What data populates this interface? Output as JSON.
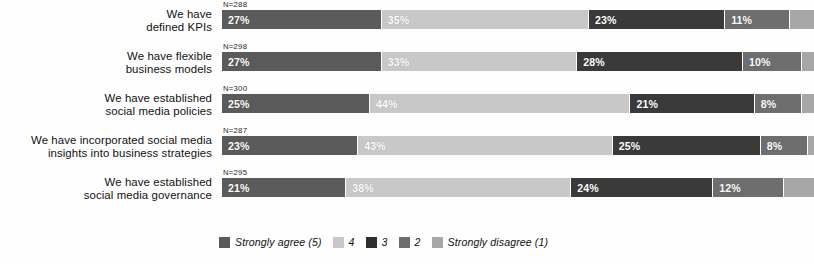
{
  "chart_data": {
    "type": "bar",
    "subtype": "100% stacked horizontal bar (Likert)",
    "title": "",
    "xlabel": "",
    "ylabel": "",
    "xlim": [
      0,
      100
    ],
    "grid": false,
    "legend_position": "bottom",
    "categories": [
      "We have defined KPIs",
      "We have flexible business models",
      "We have established social media policies",
      "We have incorporated social media insights into business strategies",
      "We have established social media governance"
    ],
    "series": [
      {
        "name": "Strongly agree (5)",
        "color": "#5b5b5b",
        "values": [
          27,
          27,
          25,
          23,
          21
        ]
      },
      {
        "name": "4",
        "color": "#c9c9c9",
        "values": [
          35,
          33,
          44,
          43,
          38
        ]
      },
      {
        "name": "3",
        "color": "#3a3a3a",
        "values": [
          23,
          28,
          21,
          25,
          24
        ]
      },
      {
        "name": "2",
        "color": "#6e6e6e",
        "values": [
          11,
          10,
          8,
          8,
          12
        ]
      },
      {
        "name": "Strongly disagree (1)",
        "color": "#a8a8a8",
        "values": [
          4,
          2,
          2,
          1,
          5
        ]
      }
    ],
    "sample_sizes": [
      "N=288",
      "N=298",
      "N=300",
      "N=287",
      "N=295"
    ]
  },
  "rows": [
    {
      "label_lines": [
        "We have",
        "defined KPIs"
      ],
      "n": "N=288",
      "segments": [
        {
          "value": 27,
          "label": "27%",
          "color": "#5b5b5b",
          "tone": "dark",
          "show_label": true
        },
        {
          "value": 35,
          "label": "35%",
          "color": "#c9c9c9",
          "tone": "light",
          "show_label": true
        },
        {
          "value": 23,
          "label": "23%",
          "color": "#3a3a3a",
          "tone": "dark",
          "show_label": true
        },
        {
          "value": 11,
          "label": "11%",
          "color": "#6e6e6e",
          "tone": "dark",
          "show_label": true
        },
        {
          "value": 4,
          "label": "4%",
          "color": "#a8a8a8",
          "tone": "light",
          "show_label": false
        }
      ]
    },
    {
      "label_lines": [
        "We have flexible",
        "business models"
      ],
      "n": "N=298",
      "segments": [
        {
          "value": 27,
          "label": "27%",
          "color": "#5b5b5b",
          "tone": "dark",
          "show_label": true
        },
        {
          "value": 33,
          "label": "33%",
          "color": "#c9c9c9",
          "tone": "light",
          "show_label": true
        },
        {
          "value": 28,
          "label": "28%",
          "color": "#3a3a3a",
          "tone": "dark",
          "show_label": true
        },
        {
          "value": 10,
          "label": "10%",
          "color": "#6e6e6e",
          "tone": "dark",
          "show_label": true
        },
        {
          "value": 2,
          "label": "2%",
          "color": "#a8a8a8",
          "tone": "light",
          "show_label": false
        }
      ]
    },
    {
      "label_lines": [
        "We have established",
        "social media policies"
      ],
      "n": "N=300",
      "segments": [
        {
          "value": 25,
          "label": "25%",
          "color": "#5b5b5b",
          "tone": "dark",
          "show_label": true
        },
        {
          "value": 44,
          "label": "44%",
          "color": "#c9c9c9",
          "tone": "light",
          "show_label": true
        },
        {
          "value": 21,
          "label": "21%",
          "color": "#3a3a3a",
          "tone": "dark",
          "show_label": true
        },
        {
          "value": 8,
          "label": "8%",
          "color": "#6e6e6e",
          "tone": "dark",
          "show_label": true
        },
        {
          "value": 2,
          "label": "2%",
          "color": "#a8a8a8",
          "tone": "light",
          "show_label": false
        }
      ]
    },
    {
      "label_lines": [
        "We have incorporated social media",
        "insights into business strategies"
      ],
      "n": "N=287",
      "segments": [
        {
          "value": 23,
          "label": "23%",
          "color": "#5b5b5b",
          "tone": "dark",
          "show_label": true
        },
        {
          "value": 43,
          "label": "43%",
          "color": "#c9c9c9",
          "tone": "light",
          "show_label": true
        },
        {
          "value": 25,
          "label": "25%",
          "color": "#3a3a3a",
          "tone": "dark",
          "show_label": true
        },
        {
          "value": 8,
          "label": "8%",
          "color": "#6e6e6e",
          "tone": "dark",
          "show_label": true
        },
        {
          "value": 1,
          "label": "1%",
          "color": "#a8a8a8",
          "tone": "light",
          "show_label": false
        }
      ]
    },
    {
      "label_lines": [
        "We have established",
        "social media governance"
      ],
      "n": "N=295",
      "segments": [
        {
          "value": 21,
          "label": "21%",
          "color": "#5b5b5b",
          "tone": "dark",
          "show_label": true
        },
        {
          "value": 38,
          "label": "38%",
          "color": "#c9c9c9",
          "tone": "light",
          "show_label": true
        },
        {
          "value": 24,
          "label": "24%",
          "color": "#3a3a3a",
          "tone": "dark",
          "show_label": true
        },
        {
          "value": 12,
          "label": "12%",
          "color": "#6e6e6e",
          "tone": "dark",
          "show_label": true
        },
        {
          "value": 5,
          "label": "5%",
          "color": "#a8a8a8",
          "tone": "light",
          "show_label": false
        }
      ]
    }
  ],
  "legend": {
    "items": [
      {
        "label": "Strongly agree (5)",
        "color": "#5b5b5b"
      },
      {
        "label": "4",
        "color": "#c9c9c9"
      },
      {
        "label": "3",
        "color": "#2f2f2f"
      },
      {
        "label": "2",
        "color": "#6e6e6e"
      },
      {
        "label": "Strongly disagree (1)",
        "color": "#a8a8a8"
      }
    ]
  }
}
